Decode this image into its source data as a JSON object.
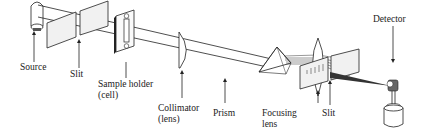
{
  "components": [
    {
      "id": "source",
      "label_lines": [
        "Source"
      ]
    },
    {
      "id": "slit-entrance",
      "label_lines": [
        "Slit"
      ]
    },
    {
      "id": "sample-holder",
      "label_lines": [
        "Sample holder",
        "(cell)"
      ]
    },
    {
      "id": "collimator",
      "label_lines": [
        "Collimator",
        "(lens)"
      ]
    },
    {
      "id": "prism",
      "label_lines": [
        "Prism"
      ]
    },
    {
      "id": "focusing-lens",
      "label_lines": [
        "Focusing",
        "lens"
      ]
    },
    {
      "id": "slit-exit",
      "label_lines": [
        "Slit"
      ]
    },
    {
      "id": "detector",
      "label_lines": [
        "Detector"
      ]
    }
  ],
  "colors": {
    "ink": "#222222",
    "panel_fill": "#f1f1f1",
    "background": "#ffffff"
  }
}
